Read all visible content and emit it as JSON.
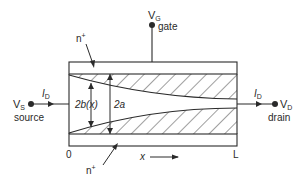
{
  "terminals": {
    "gate": {
      "symbol": "V",
      "subscript": "G",
      "name": "gate"
    },
    "source": {
      "symbol": "V",
      "subscript": "S",
      "name": "source"
    },
    "drain": {
      "symbol": "V",
      "subscript": "D",
      "name": "drain"
    }
  },
  "current": {
    "symbol": "I",
    "subscript": "D"
  },
  "regions": {
    "top": "n",
    "top_sup": "+",
    "bottom": "n",
    "bottom_sup": "+"
  },
  "dimensions": {
    "channel_width": "2b(x)",
    "full_width": "2a"
  },
  "axis": {
    "start": "0",
    "end": "L",
    "variable": "x"
  },
  "colors": {
    "line": "#2a2a2a",
    "background": "#ffffff"
  }
}
